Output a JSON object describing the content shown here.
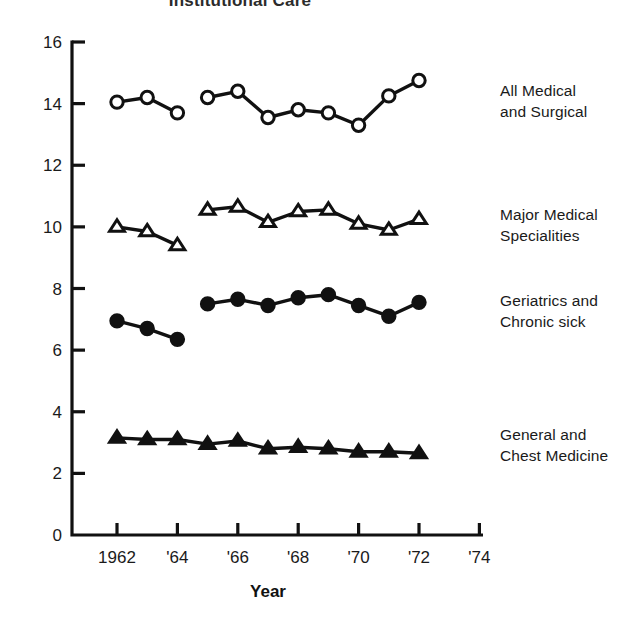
{
  "chart_data": {
    "type": "line",
    "title": "Institutional Care",
    "xlabel": "Year",
    "ylabel": "",
    "xlim": [
      1961,
      1974.6
    ],
    "ylim": [
      0,
      16.6
    ],
    "xticks": [
      1962,
      1964,
      1966,
      1968,
      1970,
      1972,
      1974
    ],
    "xticklabels": [
      "1962",
      "'64",
      "'66",
      "'68",
      "'70",
      "'72",
      "'74"
    ],
    "yticks": [
      0,
      2,
      4,
      6,
      8,
      10,
      12,
      14,
      16
    ],
    "yticklabels": [
      "0",
      "2",
      "4",
      "6",
      "8",
      "10",
      "12",
      "14",
      "16"
    ],
    "grid": false,
    "legend_position": "right-inline-annotations",
    "series": [
      {
        "name": "All Medical and Surgical",
        "marker": "open-circle",
        "x": [
          1962,
          1963,
          1964,
          1965,
          1966,
          1967,
          1968,
          1969,
          1970,
          1971,
          1972
        ],
        "values": [
          14.05,
          14.2,
          13.7,
          14.2,
          14.4,
          13.55,
          13.8,
          13.7,
          13.3,
          14.25,
          14.75
        ],
        "break_after_x": 1964
      },
      {
        "name": "Major Medical Specialities",
        "marker": "open-triangle",
        "x": [
          1962,
          1963,
          1964,
          1965,
          1966,
          1967,
          1968,
          1969,
          1970,
          1971,
          1972
        ],
        "values": [
          10.0,
          9.85,
          9.4,
          10.55,
          10.65,
          10.15,
          10.5,
          10.55,
          10.1,
          9.9,
          10.25
        ],
        "break_after_x": 1964
      },
      {
        "name": "Geriatrics and Chronic sick",
        "marker": "filled-circle",
        "x": [
          1962,
          1963,
          1964,
          1965,
          1966,
          1967,
          1968,
          1969,
          1970,
          1971,
          1972
        ],
        "values": [
          6.95,
          6.7,
          6.35,
          7.5,
          7.65,
          7.45,
          7.7,
          7.8,
          7.45,
          7.1,
          7.55
        ],
        "break_after_x": 1964
      },
      {
        "name": "General and Chest Medicine",
        "marker": "filled-triangle",
        "x": [
          1962,
          1963,
          1964,
          1965,
          1966,
          1967,
          1968,
          1969,
          1970,
          1971,
          1972
        ],
        "values": [
          3.15,
          3.1,
          3.1,
          2.95,
          3.05,
          2.8,
          2.85,
          2.8,
          2.7,
          2.7,
          2.65
        ],
        "break_after_x": null
      }
    ]
  },
  "labels": {
    "all_medical": "All Medical\nand Surgical",
    "major_medical": "Major Medical\nSpecialities",
    "geriatrics": "Geriatrics and\nChronic sick",
    "general": "General and\nChest Medicine"
  }
}
